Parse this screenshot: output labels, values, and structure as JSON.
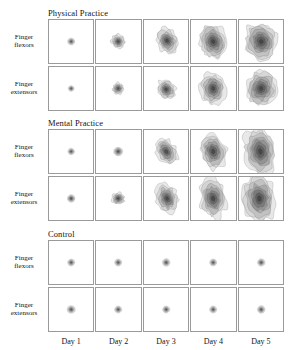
{
  "figure": {
    "type": "contour-map-grid",
    "columns": [
      "Day 1",
      "Day 2",
      "Day 3",
      "Day 4",
      "Day 5"
    ],
    "muscle_rows": [
      "Finger flexors",
      "Finger extensors"
    ],
    "conditions": [
      "Physical Practice",
      "Mental Practice",
      "Control"
    ],
    "contour_color": "#2b2b2b",
    "panel_border_color": "#9a9a9a",
    "background_color": "#ffffff"
  },
  "groups": [
    {
      "title": "Physical Practice",
      "rows": [
        {
          "label_line1": "Finger",
          "label_line2": "flexors",
          "cells": [
            {
              "day": "Day 1",
              "size": 0.16,
              "rings": 4,
              "shape": "round",
              "cx": 0.5,
              "cy": 0.5,
              "rotate": 0,
              "ar": 1.0
            },
            {
              "day": "Day 2",
              "size": 0.3,
              "rings": 6,
              "shape": "lobed",
              "cx": 0.5,
              "cy": 0.5,
              "rotate": -10,
              "ar": 1.05
            },
            {
              "day": "Day 3",
              "size": 0.46,
              "rings": 7,
              "shape": "lobed",
              "cx": 0.52,
              "cy": 0.48,
              "rotate": -20,
              "ar": 1.25
            },
            {
              "day": "Day 4",
              "size": 0.62,
              "rings": 8,
              "shape": "lobed",
              "cx": 0.5,
              "cy": 0.5,
              "rotate": -15,
              "ar": 1.3
            },
            {
              "day": "Day 5",
              "size": 0.76,
              "rings": 8,
              "shape": "lobed",
              "cx": 0.5,
              "cy": 0.5,
              "rotate": -8,
              "ar": 1.15
            }
          ]
        },
        {
          "label_line1": "Finger",
          "label_line2": "extensors",
          "cells": [
            {
              "day": "Day 1",
              "size": 0.13,
              "rings": 4,
              "shape": "round",
              "cx": 0.5,
              "cy": 0.5,
              "rotate": 0,
              "ar": 1.0
            },
            {
              "day": "Day 2",
              "size": 0.26,
              "rings": 5,
              "shape": "lobed",
              "cx": 0.5,
              "cy": 0.5,
              "rotate": 15,
              "ar": 1.05
            },
            {
              "day": "Day 3",
              "size": 0.4,
              "rings": 6,
              "shape": "lobed",
              "cx": 0.5,
              "cy": 0.52,
              "rotate": -25,
              "ar": 1.2
            },
            {
              "day": "Day 4",
              "size": 0.56,
              "rings": 7,
              "shape": "lobed",
              "cx": 0.5,
              "cy": 0.5,
              "rotate": -5,
              "ar": 1.35
            },
            {
              "day": "Day 5",
              "size": 0.7,
              "rings": 8,
              "shape": "lobed",
              "cx": 0.5,
              "cy": 0.5,
              "rotate": 10,
              "ar": 1.2
            }
          ]
        }
      ]
    },
    {
      "title": "Mental Practice",
      "rows": [
        {
          "label_line1": "Finger",
          "label_line2": "flexors",
          "cells": [
            {
              "day": "Day 1",
              "size": 0.15,
              "rings": 4,
              "shape": "round",
              "cx": 0.5,
              "cy": 0.5,
              "rotate": 0,
              "ar": 1.0
            },
            {
              "day": "Day 2",
              "size": 0.2,
              "rings": 5,
              "shape": "round",
              "cx": 0.5,
              "cy": 0.5,
              "rotate": 0,
              "ar": 1.0
            },
            {
              "day": "Day 3",
              "size": 0.44,
              "rings": 6,
              "shape": "lobed",
              "cx": 0.5,
              "cy": 0.5,
              "rotate": -30,
              "ar": 1.45
            },
            {
              "day": "Day 4",
              "size": 0.58,
              "rings": 7,
              "shape": "lobed",
              "cx": 0.5,
              "cy": 0.5,
              "rotate": -12,
              "ar": 1.45
            },
            {
              "day": "Day 5",
              "size": 0.72,
              "rings": 8,
              "shape": "lobed",
              "cx": 0.48,
              "cy": 0.5,
              "rotate": -10,
              "ar": 1.55
            }
          ]
        },
        {
          "label_line1": "Finger",
          "label_line2": "extensors",
          "cells": [
            {
              "day": "Day 1",
              "size": 0.17,
              "rings": 5,
              "shape": "round",
              "cx": 0.5,
              "cy": 0.5,
              "rotate": 0,
              "ar": 1.0
            },
            {
              "day": "Day 2",
              "size": 0.28,
              "rings": 6,
              "shape": "lobed",
              "cx": 0.5,
              "cy": 0.5,
              "rotate": 5,
              "ar": 1.0
            },
            {
              "day": "Day 3",
              "size": 0.48,
              "rings": 7,
              "shape": "lobed",
              "cx": 0.52,
              "cy": 0.5,
              "rotate": -18,
              "ar": 1.4
            },
            {
              "day": "Day 4",
              "size": 0.6,
              "rings": 7,
              "shape": "lobed",
              "cx": 0.5,
              "cy": 0.5,
              "rotate": -8,
              "ar": 1.5
            },
            {
              "day": "Day 5",
              "size": 0.74,
              "rings": 8,
              "shape": "lobed",
              "cx": 0.46,
              "cy": 0.5,
              "rotate": -5,
              "ar": 1.45
            }
          ]
        }
      ]
    },
    {
      "title": "Control",
      "rows": [
        {
          "label_line1": "Finger",
          "label_line2": "flexors",
          "cells": [
            {
              "day": "Day 1",
              "size": 0.16,
              "rings": 4,
              "shape": "round",
              "cx": 0.5,
              "cy": 0.5,
              "rotate": 0,
              "ar": 1.0
            },
            {
              "day": "Day 2",
              "size": 0.16,
              "rings": 4,
              "shape": "round",
              "cx": 0.5,
              "cy": 0.5,
              "rotate": 0,
              "ar": 1.0
            },
            {
              "day": "Day 3",
              "size": 0.17,
              "rings": 4,
              "shape": "round",
              "cx": 0.5,
              "cy": 0.5,
              "rotate": 0,
              "ar": 1.05
            },
            {
              "day": "Day 4",
              "size": 0.16,
              "rings": 4,
              "shape": "round",
              "cx": 0.5,
              "cy": 0.5,
              "rotate": 0,
              "ar": 1.0
            },
            {
              "day": "Day 5",
              "size": 0.17,
              "rings": 4,
              "shape": "round",
              "cx": 0.5,
              "cy": 0.5,
              "rotate": 0,
              "ar": 1.0
            }
          ]
        },
        {
          "label_line1": "Finger",
          "label_line2": "extensors",
          "cells": [
            {
              "day": "Day 1",
              "size": 0.18,
              "rings": 4,
              "shape": "round",
              "cx": 0.5,
              "cy": 0.5,
              "rotate": 0,
              "ar": 1.0
            },
            {
              "day": "Day 2",
              "size": 0.16,
              "rings": 4,
              "shape": "round",
              "cx": 0.5,
              "cy": 0.5,
              "rotate": 0,
              "ar": 1.0
            },
            {
              "day": "Day 3",
              "size": 0.16,
              "rings": 4,
              "shape": "round",
              "cx": 0.5,
              "cy": 0.5,
              "rotate": 0,
              "ar": 1.0
            },
            {
              "day": "Day 4",
              "size": 0.16,
              "rings": 4,
              "shape": "round",
              "cx": 0.5,
              "cy": 0.5,
              "rotate": 0,
              "ar": 1.0
            },
            {
              "day": "Day 5",
              "size": 0.17,
              "rings": 4,
              "shape": "round",
              "cx": 0.5,
              "cy": 0.5,
              "rotate": 0,
              "ar": 1.05
            }
          ]
        }
      ]
    }
  ],
  "axis": {
    "day_labels": [
      "Day 1",
      "Day 2",
      "Day 3",
      "Day 4",
      "Day 5"
    ]
  }
}
